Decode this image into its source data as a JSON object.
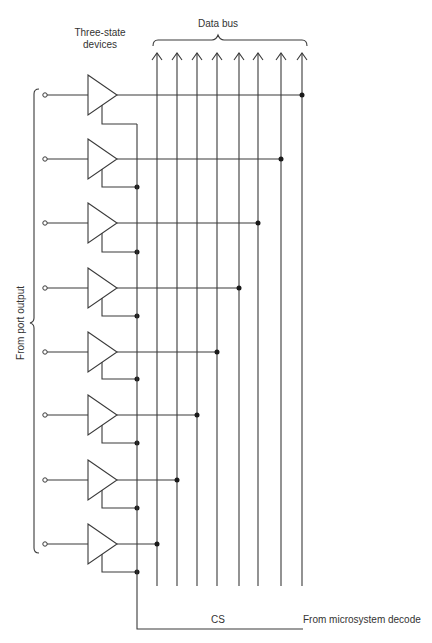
{
  "diagram": {
    "labels": {
      "devices_line1": "Three-state",
      "devices_line2": "devices",
      "data_bus": "Data bus",
      "port_output": "From port output",
      "cs": "CS",
      "decode": "From microsystem decode"
    },
    "bus_line_x": [
      157,
      177,
      197,
      217,
      239,
      258,
      281,
      302
    ],
    "buffers": [
      {
        "index": 1,
        "y": 95,
        "enable_y": 124,
        "connects_to_bus": 8
      },
      {
        "index": 2,
        "y": 159,
        "enable_y": 187,
        "connects_to_bus": 7
      },
      {
        "index": 3,
        "y": 223,
        "enable_y": 252,
        "connects_to_bus": 6
      },
      {
        "index": 4,
        "y": 288,
        "enable_y": 316,
        "connects_to_bus": 5
      },
      {
        "index": 5,
        "y": 352,
        "enable_y": 379,
        "connects_to_bus": 4
      },
      {
        "index": 6,
        "y": 415,
        "enable_y": 443,
        "connects_to_bus": 3
      },
      {
        "index": 7,
        "y": 480,
        "enable_y": 508,
        "connects_to_bus": 2
      },
      {
        "index": 8,
        "y": 544,
        "enable_y": 572,
        "connects_to_bus": 1
      }
    ],
    "colors": {
      "line": "#3a3a3a",
      "junction": "#1a1a1a",
      "background": "#ffffff"
    }
  }
}
